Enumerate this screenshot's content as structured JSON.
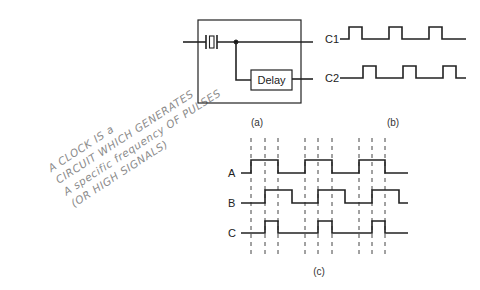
{
  "handwritten_note": {
    "lines": [
      "A CLOCK IS a",
      "CIRCUIT WHICH GENERATES",
      "A specific frequency OF PULSES",
      "(OR HIGH SIGNALS)"
    ]
  },
  "circuit": {
    "component_label": "Delay",
    "outputs": [
      "C1",
      "C2"
    ],
    "caption": "(a)"
  },
  "clock_waveforms": {
    "caption": "(b)",
    "signals": [
      {
        "name": "C1",
        "pulses": [
          [
            349,
            362
          ],
          [
            389,
            402
          ],
          [
            429,
            442
          ]
        ]
      },
      {
        "name": "C2",
        "pulses": [
          [
            363,
            376
          ],
          [
            403,
            416
          ],
          [
            443,
            456
          ]
        ]
      }
    ]
  },
  "timing_diagram": {
    "caption": "(c)",
    "signals": [
      {
        "name": "A",
        "pulses": [
          [
            251,
            278
          ],
          [
            305,
            332
          ],
          [
            359,
            385
          ]
        ]
      },
      {
        "name": "B",
        "pulses": [
          [
            265,
            292
          ],
          [
            318,
            345
          ],
          [
            372,
            399
          ]
        ]
      },
      {
        "name": "C",
        "pulses": [
          [
            265,
            278
          ],
          [
            318,
            332
          ],
          [
            372,
            385
          ]
        ]
      }
    ],
    "dashed_markers_x": [
      251,
      265,
      278,
      305,
      318,
      332,
      359,
      372,
      385
    ]
  }
}
